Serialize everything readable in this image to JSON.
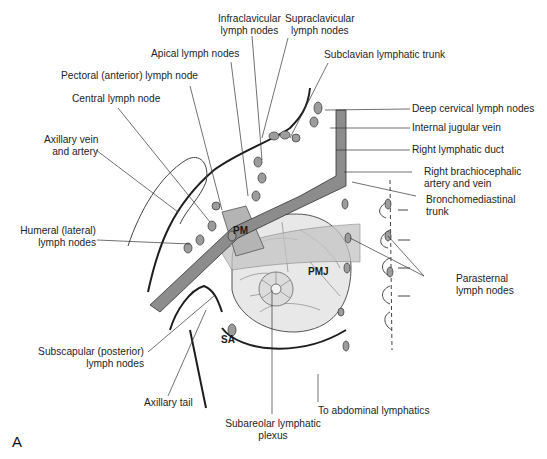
{
  "figure": {
    "panel_letter": "A",
    "colors": {
      "line": "#222222",
      "vessel": "#7a7a7a",
      "node": "#9a9a9a",
      "breast": "#e6e6e6",
      "muscle": "#b8b8b8"
    }
  },
  "structures": {
    "pm": "PM",
    "pmj": "PMJ",
    "sa": "SA"
  },
  "labels": {
    "infraclavicular": [
      "Infraclavicular",
      "lymph nodes"
    ],
    "supraclavicular": [
      "Supraclavicular",
      "lymph nodes"
    ],
    "apical": "Apical lymph nodes",
    "subclavian_trunk": "Subclavian lymphatic trunk",
    "pectoral": "Pectoral (anterior) lymph node",
    "central": "Central lymph node",
    "deep_cervical": "Deep cervical lymph nodes",
    "internal_jugular": "Internal jugular vein",
    "axillary_vein": [
      "Axillary vein",
      "and artery"
    ],
    "right_lymphatic_duct": "Right lymphatic duct",
    "right_brachiocephalic": [
      "Right brachiocephalic",
      "artery and vein"
    ],
    "bronchomediastinal": [
      "Bronchomediastinal",
      "trunk"
    ],
    "humeral": [
      "Humeral (lateral)",
      "lymph nodes"
    ],
    "parasternal": [
      "Parasternal",
      "lymph nodes"
    ],
    "subscapular": [
      "Subscapular (posterior)",
      "lymph nodes"
    ],
    "axillary_tail": "Axillary tail",
    "abdominal": "To abdominal lymphatics",
    "subareolar": [
      "Subareolar lymphatic",
      "plexus"
    ]
  }
}
